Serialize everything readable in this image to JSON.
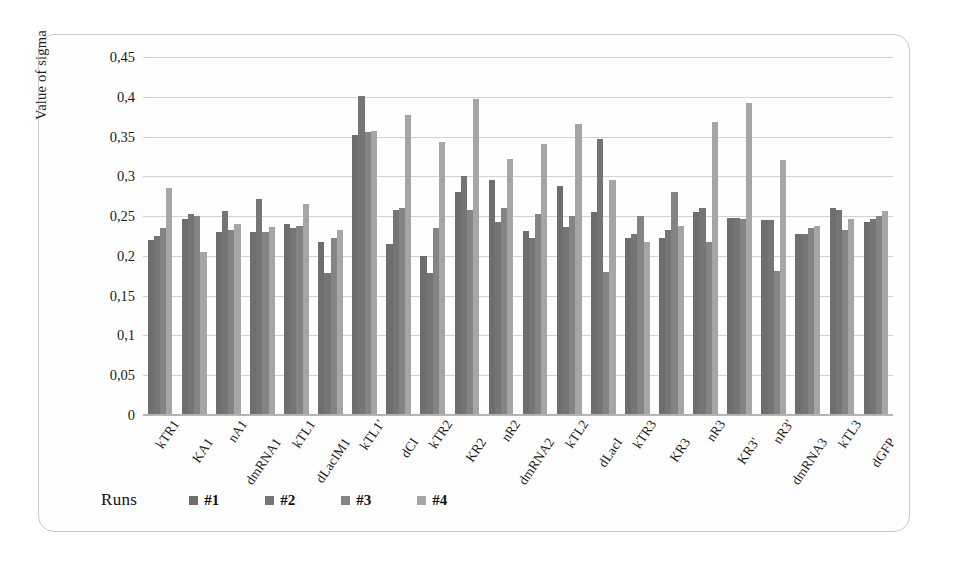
{
  "chart_data": {
    "type": "bar",
    "title": "",
    "xlabel": "",
    "ylabel": "Value of sigma",
    "ylim": [
      0,
      0.45
    ],
    "ytick_step": 0.05,
    "ytick_labels": [
      "0,45",
      "0,4",
      "0,35",
      "0,3",
      "0,25",
      "0,2",
      "0,15",
      "0,1",
      "0,05",
      "0"
    ],
    "ytick_values": [
      0.45,
      0.4,
      0.35,
      0.3,
      0.25,
      0.2,
      0.15,
      0.1,
      0.05,
      0
    ],
    "grid": true,
    "legend_position": "bottom-left",
    "legend_title": "Runs",
    "categories": [
      "kTR1",
      "KA1",
      "nA1",
      "dmRNA1",
      "kTL1",
      "dLacIM1",
      "kTL1'",
      "dCI",
      "kTR2",
      "KR2",
      "nR2",
      "dmRNA2",
      "kTL2",
      "dLacI",
      "kTR3",
      "KR3",
      "nR3",
      "KR3'",
      "nR3'",
      "dmRNA3",
      "kTL3",
      "dGFP"
    ],
    "series": [
      {
        "name": "#1",
        "color": "#6e6e6e",
        "values": [
          0.22,
          0.247,
          0.23,
          0.23,
          0.24,
          0.218,
          0.352,
          0.215,
          0.2,
          0.28,
          0.295,
          0.231,
          0.288,
          0.255,
          0.223,
          0.222,
          0.255,
          0.248,
          0.245,
          0.228,
          0.26,
          0.243
        ]
      },
      {
        "name": "#2",
        "color": "#757575",
        "values": [
          0.225,
          0.253,
          0.256,
          0.272,
          0.235,
          0.179,
          0.401,
          0.258,
          0.178,
          0.3,
          0.243,
          0.222,
          0.236,
          0.347,
          0.228,
          0.232,
          0.26,
          0.248,
          0.245,
          0.227,
          0.258,
          0.247
        ]
      },
      {
        "name": "#3",
        "color": "#848484",
        "values": [
          0.235,
          0.25,
          0.232,
          0.23,
          0.238,
          0.222,
          0.356,
          0.26,
          0.235,
          0.258,
          0.26,
          0.253,
          0.25,
          0.18,
          0.25,
          0.28,
          0.217,
          0.247,
          0.181,
          0.235,
          0.232,
          0.25
        ]
      },
      {
        "name": "#4",
        "color": "#a6a6a6",
        "values": [
          0.285,
          0.205,
          0.24,
          0.236,
          0.265,
          0.233,
          0.357,
          0.377,
          0.343,
          0.397,
          0.322,
          0.341,
          0.366,
          0.296,
          0.218,
          0.238,
          0.368,
          0.392,
          0.32,
          0.238,
          0.247,
          0.256
        ]
      }
    ]
  }
}
